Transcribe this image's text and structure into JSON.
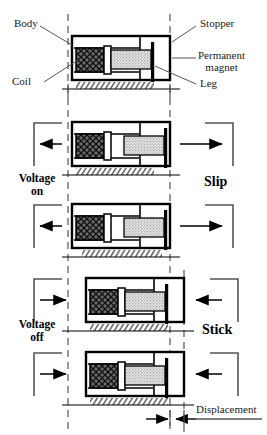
{
  "figure": {
    "type": "stick-slip-piezoelectric-actuator-sequence",
    "panel_count": 5
  },
  "callouts": {
    "body": "Body",
    "coil": "Coil",
    "stopper": "Stopper",
    "permanent_magnet_line1": "Permanent",
    "permanent_magnet_line2": "magnet",
    "leg": "Leg"
  },
  "states": {
    "voltage_on_line1": "Voltage",
    "voltage_on_line2": "on",
    "voltage_off_line1": "Voltage",
    "voltage_off_line2": "off"
  },
  "phases": {
    "slip": "Slip",
    "stick": "Stick"
  },
  "measurement": {
    "displacement": "Displacement"
  },
  "colors": {
    "ink": "#000000",
    "label_ink": "#1a1a1a",
    "coil_fill": "#4a4a4a",
    "magnet_fill": "#d8d8d8",
    "body_fill": "#ffffff",
    "guide": "#5a5a5a",
    "leader": "#555555"
  },
  "panels": [
    {
      "index": 1,
      "label": "reference",
      "body_x": 68,
      "arrows": "none"
    },
    {
      "index": 2,
      "label": "slip-start",
      "body_x": 68,
      "arrows": "outward"
    },
    {
      "index": 3,
      "label": "slip-end",
      "body_x": 68,
      "arrows": "outward"
    },
    {
      "index": 4,
      "label": "stick-start",
      "body_x": 82,
      "arrows": "inward"
    },
    {
      "index": 5,
      "label": "stick-end",
      "body_x": 82,
      "arrows": "inward"
    }
  ]
}
